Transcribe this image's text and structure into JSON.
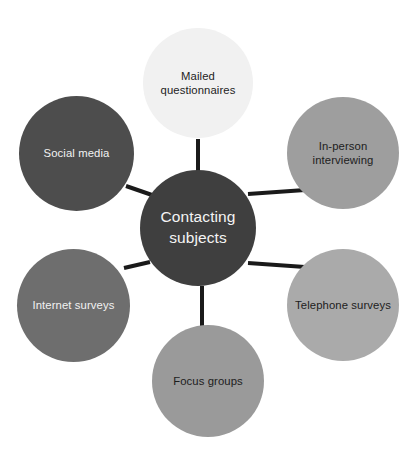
{
  "diagram": {
    "type": "hub-and-spoke",
    "background_color": "#ffffff",
    "connector_color": "#1a1a1a",
    "center": {
      "id": "contacting-subjects",
      "label": "Contacting subjects",
      "fill": "#3f3f3f",
      "text_color": "#f4f4f4"
    },
    "nodes": [
      {
        "id": "mailed-questionnaires",
        "label": "Mailed questionnaires",
        "position": "top",
        "fill": "#f1f1f1",
        "text_color": "#1d1d1d"
      },
      {
        "id": "in-person-interviewing",
        "label": "In-person interviewing",
        "position": "top-right",
        "fill": "#9e9e9e",
        "text_color": "#1d1d1d"
      },
      {
        "id": "telephone-surveys",
        "label": "Telephone surveys",
        "position": "bottom-right",
        "fill": "#aaaaaa",
        "text_color": "#1d1d1d"
      },
      {
        "id": "focus-groups",
        "label": "Focus groups",
        "position": "bottom",
        "fill": "#9a9a9a",
        "text_color": "#1d1d1d"
      },
      {
        "id": "internet-surveys",
        "label": "Internet surveys",
        "position": "bottom-left",
        "fill": "#6e6e6e",
        "text_color": "#f2f2f2"
      },
      {
        "id": "social-media",
        "label": "Social media",
        "position": "top-left",
        "fill": "#4d4d4d",
        "text_color": "#f2f2f2"
      }
    ]
  }
}
